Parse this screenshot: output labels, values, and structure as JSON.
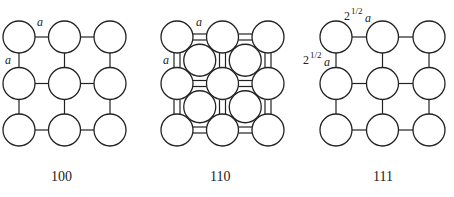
{
  "panels": [
    {
      "caption": "100",
      "horizontal_label": "a",
      "vertical_label": "a",
      "grid_origin": [
        19,
        37
      ],
      "spacing": [
        45.5,
        46.5
      ],
      "radius": 16,
      "has_inner_layer": false
    },
    {
      "caption": "110",
      "horizontal_label": "a",
      "vertical_label": "a",
      "grid_origin": [
        177,
        37
      ],
      "spacing": [
        45.5,
        46.5
      ],
      "radius": 16,
      "has_inner_layer": true
    },
    {
      "caption": "111",
      "horizontal_label_base": "2",
      "horizontal_label_exp": "1/2",
      "horizontal_label_var": "a",
      "vertical_label_base": "2",
      "vertical_label_exp": "1/2",
      "vertical_label_var": "a",
      "grid_origin": [
        336,
        37
      ],
      "spacing": [
        46.5,
        46.5
      ],
      "radius": 16,
      "has_inner_layer": false
    }
  ]
}
